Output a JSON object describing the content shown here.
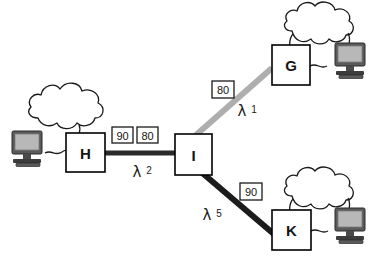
{
  "diagram": {
    "type": "network-topology",
    "background_color": "#ffffff",
    "nodes": [
      {
        "id": "H",
        "label": "H",
        "x": 66,
        "y": 133,
        "w": 39,
        "h": 39,
        "fill": "#ffffff",
        "stroke": "#000000"
      },
      {
        "id": "I",
        "label": "I",
        "x": 175,
        "y": 134,
        "w": 37,
        "h": 41,
        "fill": "#ffffff",
        "stroke": "#000000"
      },
      {
        "id": "G",
        "label": "G",
        "x": 272,
        "y": 45,
        "w": 38,
        "h": 40,
        "fill": "#ffffff",
        "stroke": "#000000"
      },
      {
        "id": "K",
        "label": "K",
        "x": 272,
        "y": 210,
        "w": 39,
        "h": 40,
        "fill": "#ffffff",
        "stroke": "#000000"
      }
    ],
    "links": [
      {
        "id": "H-I",
        "from": "H",
        "to": "I",
        "color": "#2b2b2b",
        "width": 5,
        "x1": 105,
        "y1": 153,
        "x2": 175,
        "y2": 153,
        "lambda_symbol": "λ",
        "lambda_index": "2",
        "lambda_x": 143,
        "lambda_y": 172,
        "metrics": [
          {
            "value": "90",
            "x": 112,
            "y": 127,
            "w": 21,
            "h": 16
          },
          {
            "value": "80",
            "x": 137,
            "y": 127,
            "w": 21,
            "h": 16
          }
        ]
      },
      {
        "id": "I-G",
        "from": "I",
        "to": "G",
        "color": "#aeaeae",
        "width": 6,
        "x1": 196,
        "y1": 135,
        "x2": 272,
        "y2": 68,
        "lambda_symbol": "λ",
        "lambda_index": "1",
        "lambda_x": 247,
        "lambda_y": 110,
        "metrics": [
          {
            "value": "80",
            "x": 212,
            "y": 81,
            "w": 22,
            "h": 17
          }
        ]
      },
      {
        "id": "I-K",
        "from": "I",
        "to": "K",
        "color": "#1c1c1c",
        "width": 6,
        "x1": 200,
        "y1": 171,
        "x2": 275,
        "y2": 235,
        "lambda_symbol": "λ",
        "lambda_index": "5",
        "lambda_x": 212,
        "lambda_y": 214,
        "metrics": [
          {
            "value": "90",
            "x": 240,
            "y": 183,
            "w": 22,
            "h": 17
          }
        ]
      }
    ],
    "clouds": [
      {
        "id": "cloud-h",
        "attached_to": "H",
        "cx": 62,
        "cy": 124,
        "rx": 40,
        "ry": 25
      },
      {
        "id": "cloud-g",
        "attached_to": "G",
        "cx": 314,
        "cy": 34,
        "rx": 38,
        "ry": 23
      },
      {
        "id": "cloud-k",
        "attached_to": "K",
        "cx": 314,
        "cy": 199,
        "rx": 38,
        "ry": 23
      }
    ],
    "workstations": [
      {
        "id": "workstation-h",
        "attached_to": "H",
        "x": 10,
        "y": 130,
        "w": 36,
        "h": 38,
        "screen_color": "#b4b4b4",
        "body_color": "#555555"
      },
      {
        "id": "workstation-g",
        "attached_to": "G",
        "x": 333,
        "y": 42,
        "w": 36,
        "h": 38,
        "screen_color": "#b4b4b4",
        "body_color": "#555555"
      },
      {
        "id": "workstation-k",
        "attached_to": "K",
        "x": 333,
        "y": 207,
        "w": 36,
        "h": 38,
        "screen_color": "#b4b4b4",
        "body_color": "#555555"
      }
    ]
  }
}
